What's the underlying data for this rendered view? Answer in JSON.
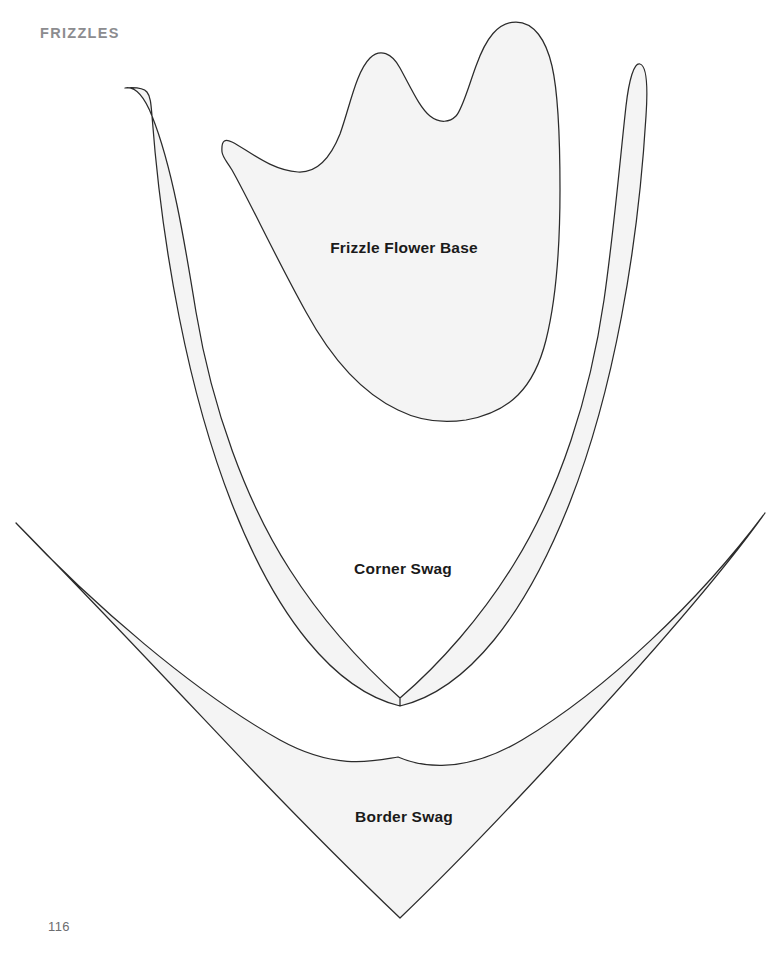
{
  "page": {
    "section_header": "FRIZZLES",
    "page_number": "116",
    "background_color": "#ffffff",
    "width": 770,
    "height": 958
  },
  "style": {
    "piece_fill_color": "#f4f4f4",
    "piece_outline_color": "#2b2b2b",
    "header_color": "#8c8c8f",
    "label_color": "#1a1a1a",
    "page_number_color": "#6d6d70"
  },
  "pattern_pieces": [
    {
      "id": "frizzle-flower-base",
      "label": "Frizzle Flower Base",
      "label_x": 404,
      "label_y": 249,
      "description": "Tulip-like three-peaked flower base template with rounded U bottom",
      "path": "M 222 152 C 221 139 226 139 232 142 C 248 150 270 170 298 172 C 316 173 330 159 340 134 C 350 106 356 72 370 58 C 380 48 392 53 400 68 C 412 90 420 108 430 116 C 440 124 450 122 456 116 C 462 110 468 88 476 66 C 486 38 498 22 516 22 C 534 22 546 40 552 66 C 558 92 560 140 560 190 C 560 250 556 300 546 340 C 534 388 510 412 466 420 C 440 424 418 420 398 410 C 360 392 330 356 306 312 C 276 258 250 202 232 170 C 226 160 223 158 222 152 Z"
    },
    {
      "id": "corner-swag",
      "label": "Corner Swag",
      "label_x": 403,
      "label_y": 570,
      "description": "Large wide V-shaped corner swag with two upward curving horns",
      "path": "M 125 88 C 135 86 144 96 152 116 C 172 166 184 238 196 312 C 212 408 246 502 290 570 C 322 620 362 664 400 698 C 440 664 482 616 514 564 C 560 490 590 396 604 300 C 614 230 620 160 626 106 C 629 80 634 62 640 64 C 647 66 648 86 646 116 C 638 248 614 390 570 502 C 526 614 468 690 400 706 C 334 690 276 616 232 504 C 188 392 162 248 152 116 C 150 92 150 86 125 88 Z M 400 698 L 400 706 Z"
    },
    {
      "id": "border-swag",
      "label": "Border Swag",
      "label_x": 404,
      "label_y": 818,
      "description": "Long shallow crescent border swag with sharp outer tips",
      "path": "M 16 523 C 92 600 180 694 256 774 C 306 826 358 878 400 918 C 444 876 498 820 550 764 C 630 678 716 582 765 513 C 700 600 606 690 522 740 C 458 778 414 764 398 757 C 378 760 338 772 280 740 C 194 692 92 604 16 523 Z"
    }
  ]
}
